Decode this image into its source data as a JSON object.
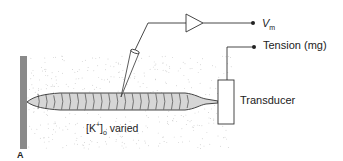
{
  "labels": {
    "vm_main": "V",
    "vm_sub": "m",
    "tension": "Tension (mg)",
    "transducer": "Transducer",
    "k_bracket_open": "[K",
    "k_sup": "+",
    "k_bracket_close": "]",
    "k_sub": "o",
    "k_suffix": " varied",
    "panel_letter": "A"
  },
  "colors": {
    "line": "#333333",
    "wall": "#8a8a8a",
    "muscle_fill": "#d6d6d6",
    "bath_dots": "#b5b5b5"
  },
  "muscle": {
    "segment_count": 20
  }
}
